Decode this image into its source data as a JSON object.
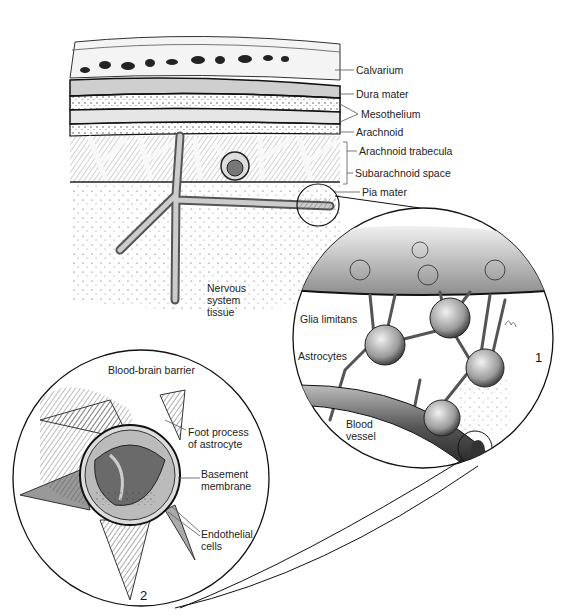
{
  "figure": {
    "top_section": {
      "labels": [
        {
          "text": "Calvarium",
          "x": 356,
          "y": 64
        },
        {
          "text": "Dura mater",
          "x": 356,
          "y": 88
        },
        {
          "text": "Mesothelium",
          "x": 361,
          "y": 108
        },
        {
          "text": "Arachnoid",
          "x": 356,
          "y": 126
        },
        {
          "text": "Arachnoid trabecula",
          "x": 359,
          "y": 145
        },
        {
          "text": "Subarachnoid space",
          "x": 355,
          "y": 167
        },
        {
          "text": "Pia mater",
          "x": 362,
          "y": 186
        }
      ],
      "tissue_label": "Nervous system tissue",
      "tissue_lines": [
        "Nervous",
        "system",
        "tissue"
      ]
    },
    "inset_1": {
      "number": "1",
      "labels": [
        {
          "text": "Glia limitans",
          "x": 300,
          "y": 313
        },
        {
          "text": "Astrocytes",
          "x": 298,
          "y": 350
        },
        {
          "text": "Blood vessel",
          "lines": [
            "Blood",
            "vessel"
          ],
          "x": 346,
          "y": 418
        }
      ]
    },
    "inset_2": {
      "number": "2",
      "title": "Blood-brain barrier",
      "labels": [
        {
          "text": "Foot process of astrocyte",
          "lines": [
            "Foot process",
            "of astrocyte"
          ],
          "x": 188,
          "y": 426
        },
        {
          "text": "Basement membrane",
          "lines": [
            "Basement",
            "membrane"
          ],
          "x": 201,
          "y": 468
        },
        {
          "text": "Endothelial cells",
          "lines": [
            "Endothelial",
            "cells"
          ],
          "x": 201,
          "y": 528
        }
      ]
    }
  }
}
